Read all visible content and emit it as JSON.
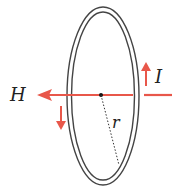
{
  "diagram": {
    "labels": {
      "field": "H",
      "current": "I",
      "radius": "r"
    },
    "colors": {
      "field_arrow": "#e8574a",
      "current_arrow": "#e8574a",
      "loop": "#444444",
      "radius_line": "#333333",
      "text": "#222222"
    }
  }
}
